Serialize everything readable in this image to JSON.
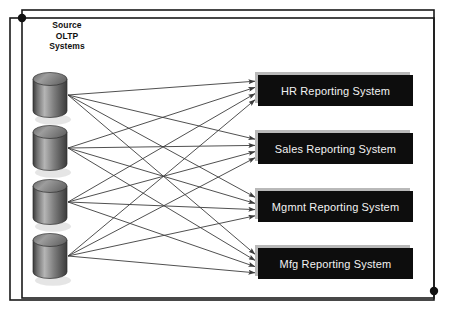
{
  "diagram": {
    "title_lines": [
      "Source",
      "OLTP",
      "Systems"
    ],
    "background_color": "#ffffff",
    "frame": {
      "line_color": "#1a1a1a",
      "dot_color": "#111111",
      "outer": {
        "x": 10,
        "y": 18,
        "w": 424,
        "h": 282
      },
      "inner": {
        "x": 22,
        "y": 10,
        "w": 412,
        "h": 288
      },
      "dots": [
        {
          "name": "frame-dot-top-left",
          "cx": 22,
          "cy": 18,
          "r": 4.2
        },
        {
          "name": "frame-dot-bottom-right",
          "cx": 434,
          "cy": 291,
          "r": 4.2
        }
      ]
    },
    "sources": [
      {
        "id": "source-1",
        "label": "Source OLTP System 1",
        "cx": 50,
        "cy": 95
      },
      {
        "id": "source-2",
        "label": "Source OLTP System 2",
        "cx": 50,
        "cy": 148
      },
      {
        "id": "source-3",
        "label": "Source OLTP System 3",
        "cx": 50,
        "cy": 202
      },
      {
        "id": "source-4",
        "label": "Source OLTP System 4",
        "cx": 50,
        "cy": 256
      }
    ],
    "cylinder": {
      "width": 34,
      "body_height": 32,
      "ellipse_ry": 6.5,
      "top_color": "#8a8a8a",
      "edge_color": "#3a3a3a",
      "highlight_color": "#b5b5b5",
      "shadow_color": "#cfcfcf"
    },
    "targets": [
      {
        "id": "target-hr",
        "label": "HR Reporting System",
        "x": 258,
        "y": 75,
        "w": 155,
        "h": 31
      },
      {
        "id": "target-sales",
        "label": "Sales Reporting System",
        "x": 258,
        "y": 133,
        "w": 155,
        "h": 31
      },
      {
        "id": "target-mgmnt",
        "label": "Mgmnt Reporting System",
        "x": 258,
        "y": 191,
        "w": 155,
        "h": 31
      },
      {
        "id": "target-mfg",
        "label": "Mfg Reporting System",
        "x": 258,
        "y": 248,
        "w": 155,
        "h": 31
      }
    ],
    "box_style": {
      "fill_color": "#0d0d0d",
      "bevel_color": "#b9b9b9",
      "text_color": "#f2f2f2"
    },
    "connections": {
      "description": "Every source OLTP system feeds every reporting system (full 4x4 mesh)",
      "count": 16,
      "line_color": "#3c3c3c",
      "line_width": 0.9,
      "arrowhead": "solid-triangle",
      "edges": [
        {
          "from": "source-1",
          "to": "target-hr"
        },
        {
          "from": "source-1",
          "to": "target-sales"
        },
        {
          "from": "source-1",
          "to": "target-mgmnt"
        },
        {
          "from": "source-1",
          "to": "target-mfg"
        },
        {
          "from": "source-2",
          "to": "target-hr"
        },
        {
          "from": "source-2",
          "to": "target-sales"
        },
        {
          "from": "source-2",
          "to": "target-mgmnt"
        },
        {
          "from": "source-2",
          "to": "target-mfg"
        },
        {
          "from": "source-3",
          "to": "target-hr"
        },
        {
          "from": "source-3",
          "to": "target-sales"
        },
        {
          "from": "source-3",
          "to": "target-mgmnt"
        },
        {
          "from": "source-3",
          "to": "target-mfg"
        },
        {
          "from": "source-4",
          "to": "target-hr"
        },
        {
          "from": "source-4",
          "to": "target-sales"
        },
        {
          "from": "source-4",
          "to": "target-mgmnt"
        },
        {
          "from": "source-4",
          "to": "target-mfg"
        }
      ]
    }
  }
}
